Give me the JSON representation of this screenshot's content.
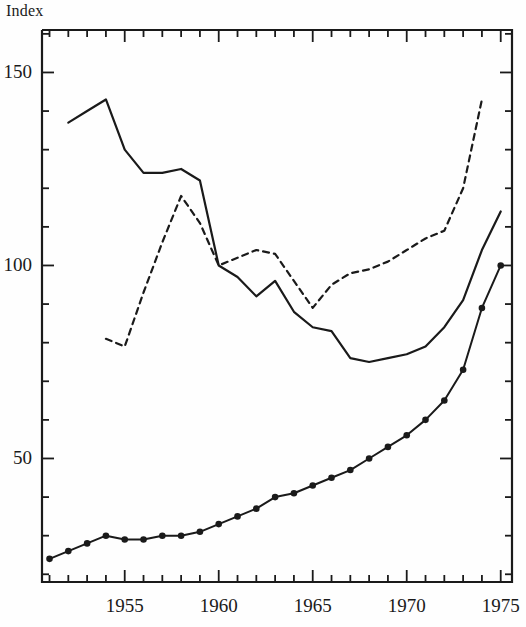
{
  "chart_data": {
    "type": "line",
    "title": "",
    "ylabel": "Index",
    "xlabel": "",
    "xlim": [
      1950.6,
      1975.6
    ],
    "ylim": [
      18,
      161
    ],
    "grid": false,
    "legend": false,
    "x_ticks_major": [
      1955,
      1960,
      1965,
      1970,
      1975
    ],
    "x_tick_labels": [
      "1955",
      "1960",
      "1965",
      "1970",
      "1975"
    ],
    "x_ticks_minor": [
      1951,
      1952,
      1953,
      1954,
      1956,
      1957,
      1958,
      1959,
      1961,
      1962,
      1963,
      1964,
      1966,
      1967,
      1968,
      1969,
      1971,
      1972,
      1973,
      1974
    ],
    "y_ticks_major": [
      50,
      100,
      150
    ],
    "y_tick_labels": [
      "50",
      "100",
      "150"
    ],
    "y_ticks_minor": [
      20,
      30,
      40,
      60,
      70,
      80,
      90,
      110,
      120,
      130,
      140,
      160
    ],
    "series": [
      {
        "name": "solid-upper",
        "style": "solid",
        "markers": false,
        "x": [
          1952,
          1953,
          1954,
          1955,
          1956,
          1957,
          1958,
          1959,
          1960,
          1961,
          1962,
          1963,
          1964,
          1965,
          1966,
          1967,
          1968,
          1969,
          1970,
          1971,
          1972,
          1973,
          1974,
          1975
        ],
        "values": [
          137,
          140,
          143,
          130,
          124,
          124,
          125,
          122,
          100,
          97,
          92,
          96,
          88,
          84,
          83,
          76,
          75,
          76,
          77,
          79,
          84,
          91,
          104,
          114
        ]
      },
      {
        "name": "dashed",
        "style": "dashed",
        "markers": false,
        "x": [
          1954,
          1955,
          1956,
          1957,
          1958,
          1959,
          1960,
          1961,
          1962,
          1963,
          1964,
          1965,
          1966,
          1967,
          1968,
          1969,
          1970,
          1971,
          1972,
          1973,
          1974
        ],
        "values": [
          81,
          79,
          93,
          106,
          118,
          111,
          100,
          102,
          104,
          103,
          96,
          89,
          95,
          98,
          99,
          101,
          104,
          107,
          109,
          120,
          143
        ]
      },
      {
        "name": "solid-with-markers",
        "style": "solid",
        "markers": true,
        "x": [
          1951,
          1952,
          1953,
          1954,
          1955,
          1956,
          1957,
          1958,
          1959,
          1960,
          1961,
          1962,
          1963,
          1964,
          1965,
          1966,
          1967,
          1968,
          1969,
          1970,
          1971,
          1972,
          1973,
          1974,
          1975
        ],
        "values": [
          24,
          26,
          28,
          30,
          29,
          29,
          30,
          30,
          31,
          33,
          35,
          37,
          40,
          41,
          43,
          45,
          47,
          50,
          53,
          56,
          60,
          65,
          73,
          89,
          100
        ]
      }
    ]
  },
  "axis": {
    "ylabel": "Index"
  },
  "colors": {
    "line": "#1a1a1a",
    "axis": "#1a1a1a",
    "background": "#fefefe"
  }
}
